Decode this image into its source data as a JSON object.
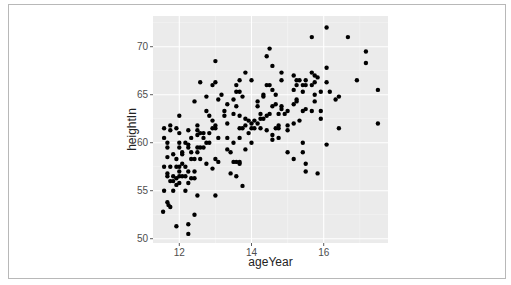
{
  "chart_data": {
    "type": "scatter",
    "title": "",
    "xlabel": "ageYear",
    "ylabel": "heightIn",
    "xlim": [
      11.4,
      17.7
    ],
    "ylim": [
      49.6,
      72.7
    ],
    "x_ticks": [
      12,
      14,
      16
    ],
    "y_ticks": [
      50,
      55,
      60,
      65,
      70
    ],
    "x_tick_labels": [
      "12",
      "14",
      "16"
    ],
    "y_tick_labels": [
      "50",
      "55",
      "60",
      "65",
      "70"
    ],
    "grid": true,
    "legend": null,
    "colors": {
      "panel_bg": "#ebebeb",
      "grid_major": "#ffffff",
      "grid_minor": "#f5f5f5",
      "point": "#000000",
      "frame_border": "#b8b8b8"
    },
    "points": [
      [
        11.58,
        61.5
      ],
      [
        11.58,
        60.5
      ],
      [
        11.58,
        57.5
      ],
      [
        11.58,
        55.0
      ],
      [
        11.55,
        52.8
      ],
      [
        11.67,
        59.5
      ],
      [
        11.67,
        60.0
      ],
      [
        11.67,
        58.5
      ],
      [
        11.67,
        56.8
      ],
      [
        11.67,
        56.5
      ],
      [
        11.67,
        53.8
      ],
      [
        11.7,
        53.5
      ],
      [
        11.75,
        53.3
      ],
      [
        11.75,
        61.8
      ],
      [
        11.75,
        61.3
      ],
      [
        11.75,
        57.5
      ],
      [
        11.75,
        56.0
      ],
      [
        11.83,
        56.0
      ],
      [
        11.83,
        58.8
      ],
      [
        11.83,
        55.0
      ],
      [
        11.83,
        56.5
      ],
      [
        11.92,
        61.5
      ],
      [
        11.92,
        57.5
      ],
      [
        11.92,
        56.3
      ],
      [
        11.92,
        55.6
      ],
      [
        11.92,
        51.3
      ],
      [
        11.92,
        58.3
      ],
      [
        12.0,
        62.8
      ],
      [
        12.0,
        61.0
      ],
      [
        12.0,
        60.0
      ],
      [
        12.0,
        59.5
      ],
      [
        12.0,
        57.5
      ],
      [
        12.0,
        57.0
      ],
      [
        12.0,
        56.5
      ],
      [
        12.0,
        55.8
      ],
      [
        12.08,
        58.8
      ],
      [
        12.08,
        59.0
      ],
      [
        12.08,
        57.8
      ],
      [
        12.08,
        56.5
      ],
      [
        12.17,
        60.0
      ],
      [
        12.17,
        57.5
      ],
      [
        12.17,
        56.5
      ],
      [
        12.17,
        55.0
      ],
      [
        12.25,
        61.3
      ],
      [
        12.25,
        59.8
      ],
      [
        12.25,
        59.5
      ],
      [
        12.25,
        57.0
      ],
      [
        12.25,
        55.8
      ],
      [
        12.25,
        51.5
      ],
      [
        12.25,
        50.5
      ],
      [
        12.33,
        60.5
      ],
      [
        12.33,
        59.0
      ],
      [
        12.33,
        58.3
      ],
      [
        12.33,
        56.3
      ],
      [
        12.42,
        57.0
      ],
      [
        12.42,
        56.3
      ],
      [
        12.42,
        64.3
      ],
      [
        12.42,
        58.3
      ],
      [
        12.42,
        52.5
      ],
      [
        12.5,
        61.8
      ],
      [
        12.5,
        61.3
      ],
      [
        12.5,
        60.8
      ],
      [
        12.5,
        59.5
      ],
      [
        12.5,
        59.0
      ],
      [
        12.5,
        54.5
      ],
      [
        12.58,
        66.3
      ],
      [
        12.58,
        61.0
      ],
      [
        12.58,
        59.5
      ],
      [
        12.58,
        58.3
      ],
      [
        12.67,
        61.0
      ],
      [
        12.67,
        60.5
      ],
      [
        12.67,
        59.5
      ],
      [
        12.75,
        64.8
      ],
      [
        12.75,
        63.3
      ],
      [
        12.75,
        60.0
      ],
      [
        12.75,
        57.8
      ],
      [
        12.83,
        62.8
      ],
      [
        12.83,
        61.0
      ],
      [
        12.83,
        60.0
      ],
      [
        12.92,
        66.0
      ],
      [
        12.92,
        62.3
      ],
      [
        12.92,
        61.5
      ],
      [
        12.92,
        57.3
      ],
      [
        13.0,
        68.5
      ],
      [
        13.0,
        66.3
      ],
      [
        13.0,
        61.8
      ],
      [
        13.0,
        61.5
      ],
      [
        13.0,
        58.3
      ],
      [
        13.0,
        54.5
      ],
      [
        13.08,
        64.5
      ],
      [
        13.08,
        60.5
      ],
      [
        13.08,
        58.0
      ],
      [
        13.17,
        65.0
      ],
      [
        13.25,
        63.3
      ],
      [
        13.25,
        62.8
      ],
      [
        13.33,
        64.0
      ],
      [
        13.33,
        62.0
      ],
      [
        13.33,
        60.5
      ],
      [
        13.33,
        59.3
      ],
      [
        13.42,
        59.0
      ],
      [
        13.42,
        56.8
      ],
      [
        13.5,
        64.5
      ],
      [
        13.5,
        63.0
      ],
      [
        13.5,
        60.0
      ],
      [
        13.5,
        58.0
      ],
      [
        13.58,
        66.0
      ],
      [
        13.58,
        65.3
      ],
      [
        13.58,
        63.8
      ],
      [
        13.58,
        58.0
      ],
      [
        13.58,
        56.5
      ],
      [
        13.67,
        66.5
      ],
      [
        13.67,
        65.3
      ],
      [
        13.67,
        62.8
      ],
      [
        13.67,
        61.5
      ],
      [
        13.67,
        60.5
      ],
      [
        13.67,
        58.0
      ],
      [
        13.67,
        57.8
      ],
      [
        13.75,
        64.8
      ],
      [
        13.75,
        61.5
      ],
      [
        13.75,
        55.5
      ],
      [
        13.83,
        67.3
      ],
      [
        13.83,
        62.5
      ],
      [
        13.83,
        61.8
      ],
      [
        13.83,
        59.3
      ],
      [
        13.92,
        62.3
      ],
      [
        13.92,
        61.0
      ],
      [
        14.0,
        66.5
      ],
      [
        14.0,
        62.0
      ],
      [
        14.0,
        61.5
      ],
      [
        14.0,
        60.0
      ],
      [
        14.08,
        62.3
      ],
      [
        14.08,
        61.5
      ],
      [
        14.17,
        64.3
      ],
      [
        14.17,
        63.8
      ],
      [
        14.17,
        62.0
      ],
      [
        14.25,
        63.0
      ],
      [
        14.25,
        62.5
      ],
      [
        14.25,
        61.5
      ],
      [
        14.33,
        65.0
      ],
      [
        14.33,
        64.8
      ],
      [
        14.33,
        62.5
      ],
      [
        14.42,
        69.0
      ],
      [
        14.42,
        66.0
      ],
      [
        14.42,
        62.8
      ],
      [
        14.42,
        61.3
      ],
      [
        14.5,
        69.8
      ],
      [
        14.5,
        66.0
      ],
      [
        14.5,
        63.0
      ],
      [
        14.58,
        68.0
      ],
      [
        14.58,
        65.5
      ],
      [
        14.58,
        63.8
      ],
      [
        14.58,
        60.8
      ],
      [
        14.58,
        60.3
      ],
      [
        14.67,
        65.0
      ],
      [
        14.67,
        64.0
      ],
      [
        14.67,
        61.5
      ],
      [
        14.75,
        63.0
      ],
      [
        14.75,
        61.8
      ],
      [
        14.75,
        61.5
      ],
      [
        14.75,
        60.5
      ],
      [
        14.83,
        67.3
      ],
      [
        14.83,
        66.5
      ],
      [
        14.83,
        63.8
      ],
      [
        14.83,
        63.5
      ],
      [
        14.92,
        63.0
      ],
      [
        15.0,
        63.3
      ],
      [
        15.0,
        61.8
      ],
      [
        15.0,
        61.3
      ],
      [
        15.0,
        59.0
      ],
      [
        15.17,
        67.0
      ],
      [
        15.17,
        65.5
      ],
      [
        15.17,
        64.0
      ],
      [
        15.17,
        62.0
      ],
      [
        15.17,
        58.3
      ],
      [
        15.25,
        66.5
      ],
      [
        15.25,
        66.0
      ],
      [
        15.25,
        64.5
      ],
      [
        15.25,
        64.3
      ],
      [
        15.33,
        66.5
      ],
      [
        15.33,
        62.3
      ],
      [
        15.42,
        66.0
      ],
      [
        15.42,
        65.3
      ],
      [
        15.42,
        63.3
      ],
      [
        15.42,
        60.0
      ],
      [
        15.42,
        59.0
      ],
      [
        15.5,
        66.5
      ],
      [
        15.5,
        66.0
      ],
      [
        15.5,
        63.5
      ],
      [
        15.5,
        57.8
      ],
      [
        15.5,
        57.0
      ],
      [
        15.67,
        71.0
      ],
      [
        15.67,
        67.3
      ],
      [
        15.67,
        66.0
      ],
      [
        15.67,
        63.3
      ],
      [
        15.75,
        67.0
      ],
      [
        15.75,
        66.3
      ],
      [
        15.75,
        65.0
      ],
      [
        15.75,
        64.3
      ],
      [
        15.83,
        66.8
      ],
      [
        15.83,
        56.8
      ],
      [
        15.92,
        65.3
      ],
      [
        15.92,
        63.3
      ],
      [
        15.92,
        62.5
      ],
      [
        16.08,
        72.0
      ],
      [
        16.08,
        67.8
      ],
      [
        16.08,
        66.3
      ],
      [
        16.08,
        59.8
      ],
      [
        16.17,
        65.3
      ],
      [
        16.33,
        64.5
      ],
      [
        16.42,
        64.8
      ],
      [
        16.42,
        61.5
      ],
      [
        16.67,
        71.0
      ],
      [
        16.92,
        66.5
      ],
      [
        17.17,
        69.5
      ],
      [
        17.17,
        68.3
      ],
      [
        17.5,
        65.5
      ],
      [
        17.5,
        62.0
      ]
    ]
  }
}
